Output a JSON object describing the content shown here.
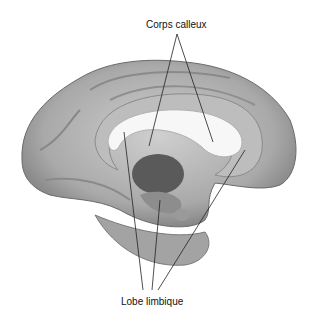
{
  "figure": {
    "labels": {
      "top": "Corps calleux",
      "bottom": "Lobe limbique"
    }
  }
}
